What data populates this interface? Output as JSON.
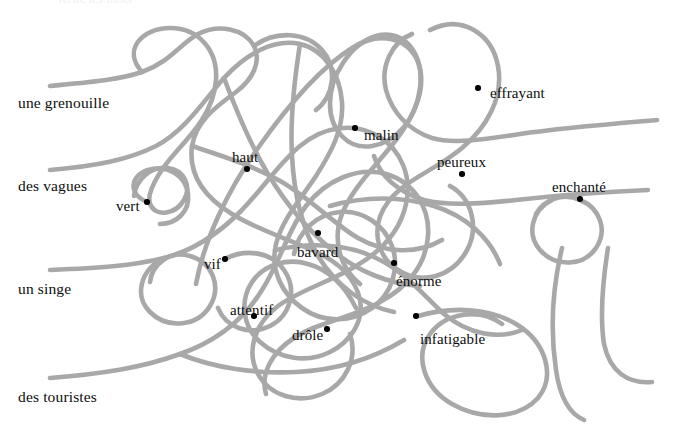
{
  "page": {
    "width": 673,
    "height": 423,
    "background_color": "#ffffff",
    "thread_color": "#a8a8a8",
    "dot_color": "#000000",
    "text_color": "#0d0d0d",
    "top_bleed_text": "Relie les mots"
  },
  "nouns": [
    {
      "label": "une grenouille",
      "x": 18,
      "y": 95,
      "thread_start_x": 50,
      "thread_start_y": 86
    },
    {
      "label": "des vagues",
      "x": 18,
      "y": 178,
      "thread_start_x": 50,
      "thread_start_y": 170
    },
    {
      "label": "un singe",
      "x": 18,
      "y": 281,
      "thread_start_x": 50,
      "thread_start_y": 270
    },
    {
      "label": "des touristes",
      "x": 18,
      "y": 389,
      "thread_start_x": 50,
      "thread_start_y": 378
    }
  ],
  "adjectives": [
    {
      "label": "effrayant",
      "text_x": 490,
      "text_y": 86,
      "dot_x": 478,
      "dot_y": 88
    },
    {
      "label": "malin",
      "text_x": 364,
      "text_y": 128,
      "dot_x": 355,
      "dot_y": 128
    },
    {
      "label": "haut",
      "text_x": 232,
      "text_y": 150,
      "dot_x": 247,
      "dot_y": 169
    },
    {
      "label": "peureux",
      "text_x": 437,
      "text_y": 155,
      "dot_x": 462,
      "dot_y": 174
    },
    {
      "label": "enchanté",
      "text_x": 552,
      "text_y": 180,
      "dot_x": 580,
      "dot_y": 199
    },
    {
      "label": "vert",
      "text_x": 116,
      "text_y": 199,
      "dot_x": 147,
      "dot_y": 202
    },
    {
      "label": "bavard",
      "text_x": 297,
      "text_y": 245,
      "dot_x": 318,
      "dot_y": 233
    },
    {
      "label": "vif",
      "text_x": 204,
      "text_y": 257,
      "dot_x": 225,
      "dot_y": 259
    },
    {
      "label": "énorme",
      "text_x": 396,
      "text_y": 274,
      "dot_x": 394,
      "dot_y": 263
    },
    {
      "label": "attentif",
      "text_x": 230,
      "text_y": 303,
      "dot_x": 254,
      "dot_y": 316
    },
    {
      "label": "drôle",
      "text_x": 292,
      "text_y": 328,
      "dot_x": 327,
      "dot_y": 329
    },
    {
      "label": "infatigable",
      "text_x": 420,
      "text_y": 332,
      "dot_x": 416,
      "dot_y": 316
    }
  ],
  "threads": [
    {
      "name": "thread-une-grenouille",
      "d": "M50,86 C92,82 118,80 142,72 C170,62 180,44 198,34 C218,24 244,28 254,46 C262,62 252,80 236,92 C214,108 196,122 192,146 C188,176 206,198 232,214 C258,230 286,238 312,250 C340,262 356,280 360,300 C364,322 350,342 330,352 C306,364 278,358 260,342 C242,326 240,300 252,282 C264,264 288,258 308,264 C330,270 346,288 356,308"
    },
    {
      "name": "thread-des-vagues",
      "d": "M50,170 C96,166 128,160 156,146 C186,130 204,100 224,78 C246,54 274,38 300,44 C326,50 340,76 342,102 C344,130 330,154 316,176 C300,200 282,220 276,244 C270,270 282,294 302,308 C324,324 352,322 372,308 C392,294 400,268 392,246 C384,224 362,210 340,212 C316,214 298,232 294,254"
    },
    {
      "name": "thread-un-singe",
      "d": "M50,270 C98,268 132,266 164,258 C196,250 220,232 240,212 C262,190 278,164 300,146 C324,126 354,122 378,136 C402,150 412,178 406,204 C400,232 380,252 356,266 C330,282 300,290 278,306 C254,324 246,352 258,374 C270,396 298,404 322,394 C346,384 358,358 350,334"
    },
    {
      "name": "thread-des-touristes",
      "d": "M50,378 C100,374 142,368 180,354 C220,340 246,316 262,290 C280,262 288,230 306,206 C326,180 358,166 386,174 C414,182 430,208 428,236 C426,266 406,288 380,302 C352,318 318,322 294,338 C272,352 260,374 266,394"
    },
    {
      "name": "thread-loop-upper-left",
      "d": "M142,72 C122,50 142,28 170,28 C200,28 218,52 216,80 C214,110 194,132 176,152 C158,172 146,194 150,204 C156,218 176,214 184,200 C192,186 184,170 168,168 C150,166 136,180 134,196"
    },
    {
      "name": "thread-center-tall-arch",
      "d": "M196,284 C204,240 228,190 258,148 C286,108 320,68 352,48 C380,30 408,38 418,62 C428,88 414,116 396,140 C376,166 352,188 342,214 C332,240 340,268 360,284"
    },
    {
      "name": "thread-right-big-loop",
      "d": "M430,30 C462,14 492,34 498,66 C504,98 486,128 462,148 C436,170 404,180 388,202 C370,226 376,256 398,270 C422,286 452,276 466,252 C480,228 472,198 450,186"
    },
    {
      "name": "thread-upper-right-oval",
      "d": "M376,36 C406,28 424,56 420,88 C416,120 396,142 372,146 C348,150 330,130 330,104 C330,76 350,44 376,36"
    },
    {
      "name": "thread-effrayant-exit",
      "d": "M657,120 C610,124 560,128 520,134 C482,140 452,144 432,138 C408,130 392,112 386,90 C380,66 392,42 412,34"
    },
    {
      "name": "thread-enchante-exit",
      "d": "M648,190 C600,192 552,196 516,200 C478,204 448,206 424,200 C398,192 380,176 374,156"
    },
    {
      "name": "thread-enchante-loop",
      "d": "M552,200 C532,210 526,234 540,250 C556,268 584,266 596,248 C608,230 600,208 580,200 C562,192 544,200 536,214"
    },
    {
      "name": "thread-right-column-a",
      "d": "M562,248 C552,290 550,330 556,370 C560,398 570,414 584,420"
    },
    {
      "name": "thread-right-column-b",
      "d": "M608,248 C602,286 600,318 604,344 C610,372 628,384 652,382"
    },
    {
      "name": "thread-infatigable-spiral",
      "d": "M418,316 C452,306 490,308 516,324 C546,342 556,376 538,398 C518,420 480,420 452,404 C424,388 414,356 430,334 C446,312 480,308 502,324"
    },
    {
      "name": "thread-lower-center-sweep",
      "d": "M276,250 C310,242 348,244 376,258 C406,272 424,296 444,314 C468,334 498,340 522,330"
    },
    {
      "name": "thread-vert-loop",
      "d": "M147,202 C128,194 130,176 148,170 C168,164 186,176 188,194 C190,212 176,224 160,224"
    },
    {
      "name": "thread-mid-knot-a",
      "d": "M192,146 C222,156 254,166 282,182 C312,200 334,224 358,238 C386,254 418,254 442,240"
    },
    {
      "name": "thread-mid-knot-b",
      "d": "M224,78 C236,110 250,144 268,174 C286,204 308,230 332,250 C358,272 390,284 420,286"
    },
    {
      "name": "thread-mid-knot-c",
      "d": "M300,44 C294,82 290,120 292,156 C294,194 302,228 318,256 C336,286 364,306 394,312"
    },
    {
      "name": "thread-lower-left-swirl",
      "d": "M164,258 C140,270 134,296 150,312 C168,330 198,326 210,306 C222,286 212,262 190,256 C170,250 152,264 150,282"
    },
    {
      "name": "thread-bottom-arc",
      "d": "M180,354 C214,368 256,374 296,372 C338,370 374,358 404,340"
    },
    {
      "name": "thread-vif-loop",
      "d": "M225,259 C246,248 272,252 284,270 C298,290 290,316 270,326 C250,336 226,328 218,308"
    },
    {
      "name": "thread-peureux-arc",
      "d": "M330,206 C364,196 402,196 434,206 C466,216 490,238 500,264"
    },
    {
      "name": "thread-top-mid-hook",
      "d": "M254,46 C276,30 306,32 322,50 C338,68 334,96 316,110"
    }
  ]
}
